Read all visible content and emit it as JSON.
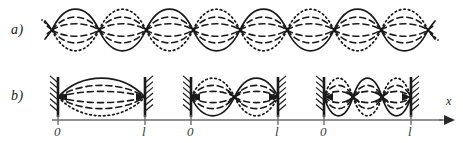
{
  "figure": {
    "type": "physics-diagram",
    "width": 463,
    "height": 143,
    "background": "#ffffff",
    "ink": "#1a1a1a",
    "axis_color": "#6e6e6e"
  },
  "rows": [
    {
      "id": "row-a",
      "label": "a)",
      "label_pos": {
        "x": 11,
        "y": 22
      },
      "description": "unbounded standing wave train",
      "baseline_y": 30,
      "node_start_x": 52,
      "node_spacing": 47,
      "node_count": 9,
      "amplitude": 21,
      "lead_x": 45,
      "tail_x": 428
    },
    {
      "id": "row-b",
      "label": "b)",
      "label_pos": {
        "x": 11,
        "y": 88
      },
      "description": "first three harmonic modes of a string fixed at both ends",
      "baseline_y": 97,
      "amplitude": 19,
      "panels": [
        {
          "id": "mode-1",
          "harmonic": 1,
          "loops": 1,
          "wall_left_x": 58,
          "wall_right_x": 145,
          "axis_y": 120,
          "tick_zero_label": "0",
          "tick_length_label": "l",
          "tick_zero_x": 58,
          "tick_length_x": 145,
          "axis_start_x": 52,
          "axis_end_x": 166,
          "first_loop_solid_up": true
        },
        {
          "id": "mode-2",
          "harmonic": 2,
          "loops": 2,
          "wall_left_x": 191,
          "wall_right_x": 278,
          "axis_y": 120,
          "tick_zero_label": "0",
          "tick_length_label": "l",
          "tick_zero_x": 191,
          "tick_length_x": 278,
          "axis_start_x": 166,
          "axis_end_x": 299,
          "first_loop_solid_up": false
        },
        {
          "id": "mode-3",
          "harmonic": 3,
          "loops": 3,
          "wall_left_x": 324,
          "wall_right_x": 411,
          "axis_y": 120,
          "tick_zero_label": "0",
          "tick_length_label": "l",
          "tick_zero_x": 324,
          "tick_length_x": 411,
          "axis_start_x": 299,
          "axis_end_x": 443,
          "first_loop_solid_up": false
        }
      ],
      "axis_arrow_label": "x",
      "axis_arrow_label_pos": {
        "x": 446,
        "y": 104
      },
      "axis_arrow_tip_x": 455
    }
  ],
  "curve_styles": {
    "solid": {
      "name": "solid-envelope",
      "dash": "none",
      "width": 1.7
    },
    "dashed": {
      "name": "dashed-intermediate",
      "dash": "6 4",
      "width": 1.6
    },
    "dotted": {
      "name": "dotted-opposite-phase",
      "dash": "1.6 3",
      "width": 1.7
    }
  },
  "wall": {
    "name": "fixed-end-wall",
    "line_width": 2.6,
    "hatch_count": 6,
    "hatch_length": 8,
    "height": 40
  },
  "chart_data": {
    "type": "line",
    "title": "",
    "xlabel": "x",
    "ylabel": "",
    "series": [
      {
        "name": "solid envelope",
        "style": "solid"
      },
      {
        "name": "dashed intermediate amplitude",
        "style": "dashed"
      },
      {
        "name": "dotted opposite phase",
        "style": "dotted"
      }
    ],
    "annotations": [
      "a)",
      "b)",
      "0",
      "l",
      "x"
    ]
  }
}
